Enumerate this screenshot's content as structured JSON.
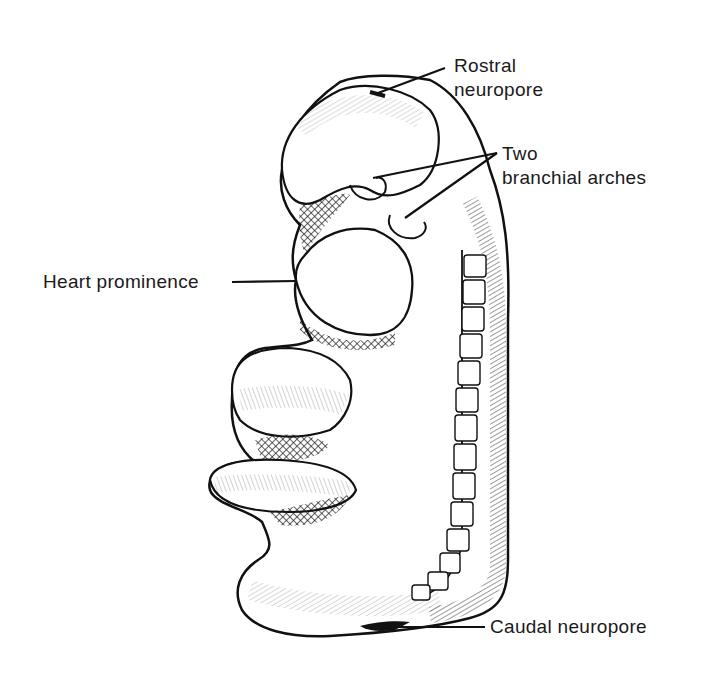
{
  "figure": {
    "labels": {
      "rostral_neuropore": {
        "line1": "Rostral",
        "line2": "neuropore"
      },
      "branchial_arches": {
        "line1": "Two",
        "line2": "branchial arches"
      },
      "heart_prominence": "Heart prominence",
      "caudal_neuropore": "Caudal neuropore"
    },
    "colors": {
      "ink": "#111111",
      "background": "#ffffff"
    }
  }
}
